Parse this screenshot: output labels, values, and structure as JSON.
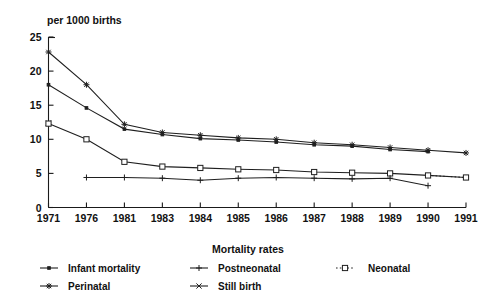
{
  "chart": {
    "y_axis_title": "per 1000 births",
    "x_axis_title": "Mortality rates",
    "y_ticks": [
      "0",
      "5",
      "10",
      "15",
      "20",
      "25"
    ],
    "x_ticks": [
      "1971",
      "1976",
      "1981",
      "1983",
      "1984",
      "1985",
      "1986",
      "1987",
      "1988",
      "1989",
      "1990",
      "1991"
    ]
  },
  "legend": {
    "title": "Mortality rates",
    "entries": [
      {
        "label": "Infant mortality",
        "marker": "dot-icon"
      },
      {
        "label": "Postneonatal",
        "marker": "plus-icon"
      },
      {
        "label": "Neonatal",
        "marker": "open-square-icon"
      },
      {
        "label": "Perinatal",
        "marker": "star-icon"
      },
      {
        "label": "Still birth",
        "marker": "cross-icon"
      }
    ]
  },
  "chart_data": {
    "type": "line",
    "title": "",
    "xlabel": "Mortality rates",
    "ylabel": "per 1000 births",
    "ylim": [
      0,
      25
    ],
    "yticks": [
      0,
      5,
      10,
      15,
      20,
      25
    ],
    "grid": false,
    "legend_position": "bottom",
    "categories": [
      "1971",
      "1976",
      "1981",
      "1983",
      "1984",
      "1985",
      "1986",
      "1987",
      "1988",
      "1989",
      "1990",
      "1991"
    ],
    "series": [
      {
        "name": "Perinatal",
        "marker": "star",
        "values": [
          22.8,
          18.0,
          12.2,
          11.0,
          10.6,
          10.2,
          10.0,
          9.5,
          9.2,
          8.8,
          8.4,
          8.0
        ]
      },
      {
        "name": "Infant mortality",
        "marker": "dot",
        "values": [
          18.0,
          14.6,
          11.5,
          10.7,
          10.1,
          9.9,
          9.6,
          9.2,
          9.0,
          8.5,
          8.2,
          null
        ]
      },
      {
        "name": "Still birth",
        "marker": "cross",
        "values": [
          12.4,
          null,
          null,
          null,
          null,
          null,
          null,
          null,
          null,
          null,
          null,
          null
        ]
      },
      {
        "name": "Neonatal",
        "marker": "open-square",
        "values": [
          12.3,
          10.0,
          6.7,
          6.0,
          5.8,
          5.6,
          5.5,
          5.2,
          5.1,
          5.0,
          4.7,
          4.4
        ]
      },
      {
        "name": "Postneonatal",
        "marker": "plus",
        "values": [
          null,
          4.4,
          4.4,
          4.3,
          4.0,
          4.3,
          4.4,
          4.3,
          4.2,
          4.3,
          3.2,
          null
        ]
      }
    ]
  }
}
